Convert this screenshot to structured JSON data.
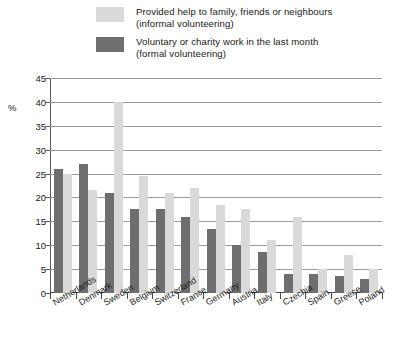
{
  "chart_data": {
    "type": "bar",
    "title": "",
    "xlabel": "",
    "ylabel": "%",
    "ylim": [
      0,
      45
    ],
    "yticks": [
      0,
      5,
      10,
      15,
      20,
      25,
      30,
      35,
      40,
      45
    ],
    "grid": true,
    "legend_position": "top",
    "categories": [
      "Netherlands",
      "Denmark",
      "Sweden",
      "Belgium",
      "Switzerland",
      "France",
      "Germany",
      "Austria",
      "Italy",
      "Czechia",
      "Spain",
      "Greece",
      "Poland"
    ],
    "series": [
      {
        "name": "Voluntary or charity work in the last month (formal volunteering)",
        "short_name": "formal volunteering",
        "color": "#6e6e6e",
        "values": [
          26,
          27,
          21,
          17.5,
          17.5,
          16,
          13.5,
          10,
          8.5,
          4,
          4,
          3.5,
          3
        ]
      },
      {
        "name": "Provided help to family, friends or neighbours (informal volunteering)",
        "short_name": "informal volunteering",
        "color": "#d9d9d9",
        "values": [
          25,
          21.5,
          40,
          24.5,
          21,
          22,
          18.5,
          17.5,
          11,
          16,
          5,
          8,
          5
        ]
      }
    ],
    "bar_order": [
      "formal",
      "informal"
    ]
  },
  "legend": {
    "items": [
      {
        "swatch_color": "#d9d9d9",
        "line1": "Provided help to family, friends or neighbours",
        "line2": "(informal volunteering)"
      },
      {
        "swatch_color": "#6e6e6e",
        "line1": "Voluntary or charity work in the last month",
        "line2": "(formal volunteering)"
      }
    ]
  },
  "axis": {
    "y_unit_label": "%"
  }
}
